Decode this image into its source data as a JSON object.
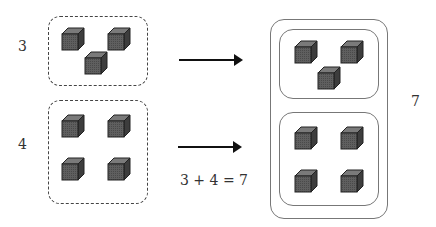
{
  "diagram": {
    "left_groups": [
      {
        "label": "3",
        "count": 3
      },
      {
        "label": "4",
        "count": 4
      }
    ],
    "equation": "3 + 4 = 7",
    "result_label": "7",
    "cube_icon": "cube-icon",
    "colors": {
      "cube_front": "#5a5a5a",
      "cube_top": "#7a7a7a",
      "cube_side": "#3d3d3d",
      "outline": "#222222"
    }
  }
}
